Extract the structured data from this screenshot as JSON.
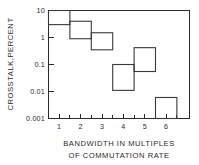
{
  "chart_data": {
    "type": "bar",
    "title": "",
    "xlabel": "BANDWIDTH IN MULTIPLES OF COMMUTATION RATE",
    "xlabel_line1": "BANDWIDTH IN MULTIPLES",
    "xlabel_line2": "OF COMMUTATION RATE",
    "ylabel": "CROSSTALK,PERCENT",
    "yscale": "log",
    "ylim": [
      0.001,
      10
    ],
    "xlim": [
      0.3,
      6.75
    ],
    "grid": false,
    "legend": null,
    "xticks": [
      1,
      2,
      3,
      4,
      5,
      6
    ],
    "xtick_labels": [
      "1",
      "2",
      "3",
      "4",
      "5",
      "6"
    ],
    "xminor_ticks": [
      1.5,
      2.5,
      3.5,
      4.5,
      5.5,
      6.5
    ],
    "yticks": [
      10,
      1,
      0.1,
      0.01,
      0.001
    ],
    "ytick_labels": [
      "10",
      "1",
      "0.1",
      "0.01",
      "0.001"
    ],
    "series": [
      {
        "name": "crosstalk",
        "boxes": [
          {
            "label": "band-1",
            "x_start": 0.5,
            "x_end": 1.5,
            "y_top": 10.0,
            "y_bottom": 3.0
          },
          {
            "label": "band-2",
            "x_start": 1.5,
            "x_end": 2.5,
            "y_top": 4.0,
            "y_bottom": 0.9
          },
          {
            "label": "band-3",
            "x_start": 2.5,
            "x_end": 3.5,
            "y_top": 1.5,
            "y_bottom": 0.35
          },
          {
            "label": "band-4",
            "x_start": 3.5,
            "x_end": 4.5,
            "y_top": 0.1,
            "y_bottom": 0.011
          },
          {
            "label": "band-5",
            "x_start": 4.5,
            "x_end": 5.5,
            "y_top": 0.42,
            "y_bottom": 0.055
          },
          {
            "label": "band-6",
            "x_start": 5.5,
            "x_end": 6.5,
            "y_top": 0.006,
            "y_bottom": 0.001
          }
        ]
      }
    ],
    "colors": {
      "line": "#3a3a3a",
      "axis": "#2b2b2b",
      "background": "#ffffff"
    }
  }
}
